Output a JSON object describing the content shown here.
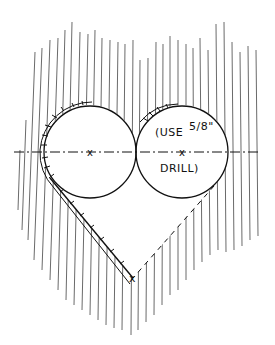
{
  "drawing": {
    "title": "Heart cutout template",
    "annotation": {
      "line1_prefix": "(USE",
      "fraction": "5/8\"",
      "line2": "DRILL)"
    },
    "center_marks": [
      "x",
      "x"
    ],
    "tip_mark": "x",
    "colors": {
      "ink": "#111111",
      "paper": "#ffffff",
      "hatch": "#444444"
    },
    "geometry": {
      "left_circle": {
        "cx": 90,
        "cy": 152,
        "r": 46
      },
      "right_circle": {
        "cx": 182,
        "cy": 152,
        "r": 46
      },
      "centerline_y": 152,
      "tip": {
        "x": 133,
        "y": 278
      }
    }
  }
}
